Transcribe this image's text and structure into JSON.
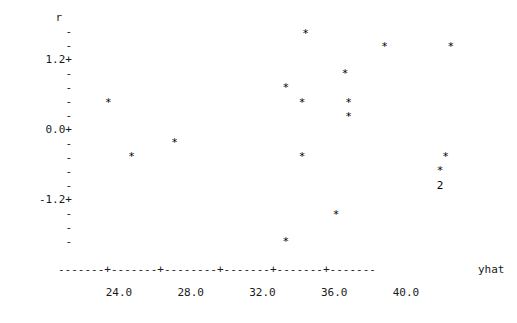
{
  "plot": {
    "kind": "ascii-residual-scatter",
    "y_axis_name": "r",
    "x_axis_name": "yhat",
    "y_labeled_ticks": [
      "1.2+",
      "0.0+",
      "-1.2+"
    ],
    "y_minor_tick_glyph": "-",
    "x_tick_labels": [
      "24.0",
      "28.0",
      "32.0",
      "36.0",
      "40.0"
    ],
    "point_glyph": "*",
    "overlap_glyph": "2",
    "axis_dash_glyph": "-",
    "axis_tick_glyph": "+"
  },
  "chart_data": {
    "type": "scatter",
    "title": "",
    "xlabel": "yhat",
    "ylabel": "r",
    "xlim": [
      21.6,
      45.0
    ],
    "ylim": [
      -2.06,
      1.91
    ],
    "grid": false,
    "legend": false,
    "x_ticks": [
      24.0,
      28.0,
      32.0,
      36.0,
      40.0
    ],
    "y_ticks": [
      1.2,
      0.0,
      -1.2
    ],
    "y_minor_ticks": [
      1.68,
      1.44,
      0.96,
      0.72,
      0.48,
      0.24,
      -0.24,
      -0.48,
      -0.72,
      -0.96,
      -1.44,
      -1.68,
      -1.92
    ],
    "marker": "*",
    "points": [
      {
        "x": 34.4,
        "y": 1.65,
        "label": "*",
        "count": 1
      },
      {
        "x": 38.8,
        "y": 1.42,
        "label": "*",
        "count": 1
      },
      {
        "x": 42.5,
        "y": 1.42,
        "label": "*",
        "count": 1
      },
      {
        "x": 36.6,
        "y": 0.96,
        "label": "*",
        "count": 1
      },
      {
        "x": 33.3,
        "y": 0.72,
        "label": "*",
        "count": 1
      },
      {
        "x": 23.4,
        "y": 0.46,
        "label": "*",
        "count": 1
      },
      {
        "x": 34.2,
        "y": 0.46,
        "label": "*",
        "count": 1
      },
      {
        "x": 36.8,
        "y": 0.46,
        "label": "*",
        "count": 1
      },
      {
        "x": 36.8,
        "y": 0.22,
        "label": "*",
        "count": 1
      },
      {
        "x": 27.1,
        "y": -0.22,
        "label": "*",
        "count": 1
      },
      {
        "x": 24.7,
        "y": -0.46,
        "label": "*",
        "count": 1
      },
      {
        "x": 34.2,
        "y": -0.46,
        "label": "*",
        "count": 1
      },
      {
        "x": 42.2,
        "y": -0.46,
        "label": "*",
        "count": 1
      },
      {
        "x": 41.9,
        "y": -0.7,
        "label": "*",
        "count": 1
      },
      {
        "x": 41.9,
        "y": -0.96,
        "label": "2",
        "count": 2
      },
      {
        "x": 36.1,
        "y": -1.46,
        "label": "*",
        "count": 1
      },
      {
        "x": 33.3,
        "y": -1.92,
        "label": "*",
        "count": 1
      }
    ],
    "n_observations": 18
  }
}
